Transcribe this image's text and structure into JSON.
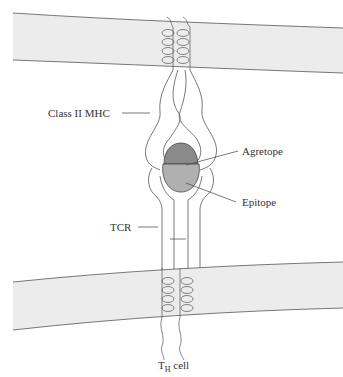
{
  "diagram": {
    "labels": {
      "class_ii_mhc": "Class II MHC",
      "agretope": "Agretope",
      "epitope": "Epitope",
      "tcr": "TCR",
      "th_cell_main": "T",
      "th_cell_sub": "H",
      "th_cell_suffix": " cell"
    },
    "colors": {
      "membrane_fill": "#ececec",
      "line": "#555555",
      "agretope_fill": "#8a8a8a",
      "epitope_fill": "#b0b0b0"
    }
  }
}
